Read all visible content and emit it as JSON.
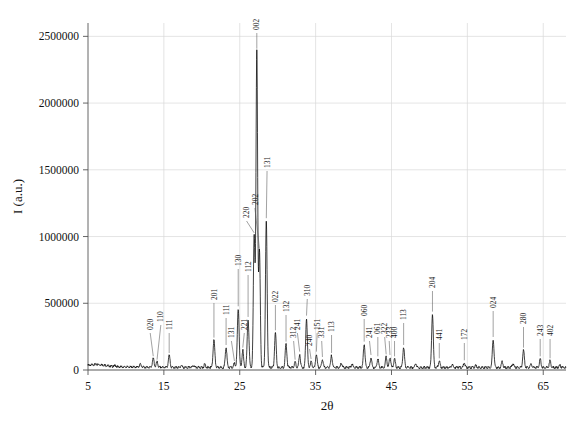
{
  "chart_data": {
    "type": "line",
    "title": "",
    "xlabel": "2θ",
    "ylabel": "I (a.u.)",
    "xlim": [
      5,
      68
    ],
    "ylim": [
      0,
      2600000
    ],
    "grid": true,
    "legend": "none",
    "xticks": [
      5,
      15,
      25,
      35,
      45,
      55,
      65
    ],
    "xticklabels": [
      "5",
      "15",
      "25",
      "35",
      "45",
      "55",
      "65"
    ],
    "yticks": [
      0,
      500000,
      1000000,
      1500000,
      2000000,
      2500000
    ],
    "yticklabels": [
      "0",
      "500000",
      "1000000",
      "1500000",
      "2000000",
      "2500000"
    ],
    "series": [
      {
        "name": "XRD pattern",
        "color": "#000000",
        "baseline": 30000,
        "peaks": [
          {
            "x": 8.6,
            "y": 38000,
            "w": 0.14,
            "label": ""
          },
          {
            "x": 11.9,
            "y": 52000,
            "w": 0.13,
            "label": ""
          },
          {
            "x": 13.6,
            "y": 96000,
            "w": 0.13,
            "label": "020"
          },
          {
            "x": 14.1,
            "y": 70000,
            "w": 0.12,
            "label": "110"
          },
          {
            "x": 15.7,
            "y": 120000,
            "w": 0.13,
            "label": "111"
          },
          {
            "x": 17.3,
            "y": 46000,
            "w": 0.12,
            "label": ""
          },
          {
            "x": 18.9,
            "y": 44000,
            "w": 0.12,
            "label": ""
          },
          {
            "x": 20.4,
            "y": 55000,
            "w": 0.12,
            "label": ""
          },
          {
            "x": 21.6,
            "y": 235000,
            "w": 0.14,
            "label": "201"
          },
          {
            "x": 23.2,
            "y": 180000,
            "w": 0.13,
            "label": "111"
          },
          {
            "x": 24.3,
            "y": 60000,
            "w": 0.12,
            "label": "131"
          },
          {
            "x": 24.8,
            "y": 470000,
            "w": 0.14,
            "label": "130"
          },
          {
            "x": 25.4,
            "y": 160000,
            "w": 0.12,
            "label": "221"
          },
          {
            "x": 26.1,
            "y": 390000,
            "w": 0.14,
            "label": "112"
          },
          {
            "x": 26.9,
            "y": 1020000,
            "w": 0.13,
            "label": "220"
          },
          {
            "x": 27.25,
            "y": 2400000,
            "w": 0.13,
            "label": "002"
          },
          {
            "x": 27.6,
            "y": 900000,
            "w": 0.13,
            "label": "202"
          },
          {
            "x": 28.5,
            "y": 1130000,
            "w": 0.13,
            "label": "131"
          },
          {
            "x": 29.7,
            "y": 290000,
            "w": 0.13,
            "label": "022"
          },
          {
            "x": 31.1,
            "y": 205000,
            "w": 0.13,
            "label": "132"
          },
          {
            "x": 32.3,
            "y": 70000,
            "w": 0.12,
            "label": "312"
          },
          {
            "x": 32.9,
            "y": 130000,
            "w": 0.12,
            "label": "241"
          },
          {
            "x": 33.8,
            "y": 400000,
            "w": 0.13,
            "label": "310"
          },
          {
            "x": 34.4,
            "y": 75000,
            "w": 0.12,
            "label": "240"
          },
          {
            "x": 35.1,
            "y": 130000,
            "w": 0.12,
            "label": "151"
          },
          {
            "x": 35.9,
            "y": 90000,
            "w": 0.12,
            "label": "331"
          },
          {
            "x": 37.1,
            "y": 120000,
            "w": 0.12,
            "label": "113"
          },
          {
            "x": 38.4,
            "y": 60000,
            "w": 0.12,
            "label": ""
          },
          {
            "x": 39.8,
            "y": 55000,
            "w": 0.12,
            "label": ""
          },
          {
            "x": 41.4,
            "y": 205000,
            "w": 0.13,
            "label": "060"
          },
          {
            "x": 42.3,
            "y": 105000,
            "w": 0.12,
            "label": "241"
          },
          {
            "x": 43.2,
            "y": 95000,
            "w": 0.12,
            "label": "061"
          },
          {
            "x": 44.3,
            "y": 110000,
            "w": 0.12,
            "label": "322"
          },
          {
            "x": 44.8,
            "y": 105000,
            "w": 0.12,
            "label": "233"
          },
          {
            "x": 45.4,
            "y": 95000,
            "w": 0.12,
            "label": "400"
          },
          {
            "x": 46.6,
            "y": 180000,
            "w": 0.13,
            "label": "113"
          },
          {
            "x": 48.2,
            "y": 60000,
            "w": 0.12,
            "label": ""
          },
          {
            "x": 50.4,
            "y": 430000,
            "w": 0.13,
            "label": "204"
          },
          {
            "x": 51.3,
            "y": 80000,
            "w": 0.12,
            "label": "441"
          },
          {
            "x": 53.0,
            "y": 50000,
            "w": 0.12,
            "label": ""
          },
          {
            "x": 54.6,
            "y": 65000,
            "w": 0.12,
            "label": "172"
          },
          {
            "x": 56.1,
            "y": 45000,
            "w": 0.12,
            "label": ""
          },
          {
            "x": 58.4,
            "y": 240000,
            "w": 0.13,
            "label": "024"
          },
          {
            "x": 59.6,
            "y": 75000,
            "w": 0.12,
            "label": ""
          },
          {
            "x": 61.0,
            "y": 60000,
            "w": 0.12,
            "label": ""
          },
          {
            "x": 62.4,
            "y": 160000,
            "w": 0.13,
            "label": "280"
          },
          {
            "x": 63.4,
            "y": 55000,
            "w": 0.12,
            "label": ""
          },
          {
            "x": 64.6,
            "y": 95000,
            "w": 0.12,
            "label": "243"
          },
          {
            "x": 65.9,
            "y": 80000,
            "w": 0.12,
            "label": "402"
          },
          {
            "x": 67.2,
            "y": 45000,
            "w": 0.12,
            "label": ""
          }
        ]
      }
    ],
    "peak_labels": [
      {
        "text": "020",
        "x": 13.6
      },
      {
        "text": "110",
        "x": 14.1
      },
      {
        "text": "111",
        "x": 15.7
      },
      {
        "text": "201",
        "x": 21.6
      },
      {
        "text": "111",
        "x": 23.2
      },
      {
        "text": "131",
        "x": 24.3
      },
      {
        "text": "130",
        "x": 24.8
      },
      {
        "text": "221",
        "x": 25.4
      },
      {
        "text": "112",
        "x": 26.1
      },
      {
        "text": "220",
        "x": 26.9
      },
      {
        "text": "002",
        "x": 27.25
      },
      {
        "text": "202",
        "x": 27.6
      },
      {
        "text": "131",
        "x": 28.5
      },
      {
        "text": "022",
        "x": 29.7
      },
      {
        "text": "132",
        "x": 31.1
      },
      {
        "text": "312",
        "x": 32.3
      },
      {
        "text": "241",
        "x": 32.9
      },
      {
        "text": "310",
        "x": 33.8
      },
      {
        "text": "240",
        "x": 34.4
      },
      {
        "text": "151",
        "x": 35.1
      },
      {
        "text": "331",
        "x": 35.9
      },
      {
        "text": "113",
        "x": 37.1
      },
      {
        "text": "060",
        "x": 41.4
      },
      {
        "text": "241",
        "x": 42.3
      },
      {
        "text": "061",
        "x": 43.2
      },
      {
        "text": "322",
        "x": 44.3
      },
      {
        "text": "233",
        "x": 44.8
      },
      {
        "text": "400",
        "x": 45.4
      },
      {
        "text": "113",
        "x": 46.6
      },
      {
        "text": "204",
        "x": 50.4
      },
      {
        "text": "441",
        "x": 51.3
      },
      {
        "text": "172",
        "x": 54.6
      },
      {
        "text": "024",
        "x": 58.4
      },
      {
        "text": "280",
        "x": 62.4
      },
      {
        "text": "243",
        "x": 64.6
      },
      {
        "text": "402",
        "x": 65.9
      }
    ]
  },
  "axes": {
    "x_title": "2θ",
    "y_title": "I (a.u.)"
  },
  "style": {
    "line_color": "#000000",
    "grid_color": "#d8d8d8",
    "axis_color": "#555555",
    "background": "#ffffff"
  }
}
